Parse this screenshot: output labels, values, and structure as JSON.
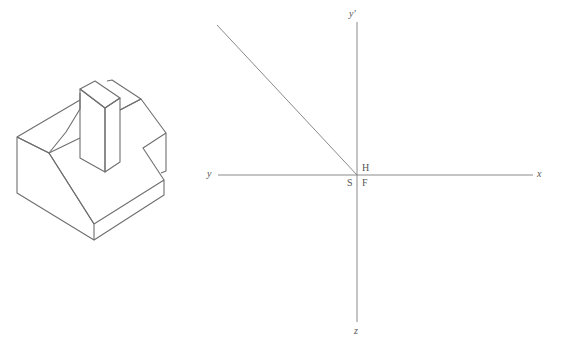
{
  "figure": {
    "axes_labels": {
      "y_top": "y'",
      "y_left": "y",
      "x_right": "x",
      "z_bottom": "z",
      "quadrant_h": "H",
      "quadrant_s": "S",
      "quadrant_f": "F"
    },
    "colors": {
      "line": "#8a8a8a",
      "object": "#6f6f6f"
    }
  }
}
